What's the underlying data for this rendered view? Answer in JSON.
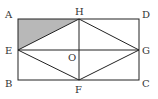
{
  "diagram": {
    "type": "geometry",
    "shaded_region": "triangle A-E-H",
    "colors": {
      "line": "#222222",
      "shade": "#b8b8b8",
      "background": "#ffffff"
    },
    "points": {
      "A": {
        "label": "A",
        "x": 18,
        "y": 19
      },
      "B": {
        "label": "B",
        "x": 18,
        "y": 80
      },
      "C": {
        "label": "C",
        "x": 139,
        "y": 80
      },
      "D": {
        "label": "D",
        "x": 139,
        "y": 19
      },
      "E": {
        "label": "E",
        "x": 18,
        "y": 50
      },
      "F": {
        "label": "F",
        "x": 79,
        "y": 80
      },
      "G": {
        "label": "G",
        "x": 139,
        "y": 50
      },
      "H": {
        "label": "H",
        "x": 79,
        "y": 19
      },
      "O": {
        "label": "O",
        "x": 79,
        "y": 50
      }
    },
    "segments": [
      "AB",
      "BC",
      "CD",
      "DA",
      "EH",
      "HG",
      "GF",
      "FE",
      "EG",
      "HF"
    ]
  }
}
